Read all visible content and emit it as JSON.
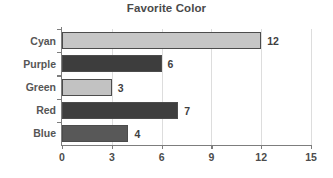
{
  "chart_data": {
    "type": "bar",
    "orientation": "horizontal",
    "title": "Favorite Color",
    "xlabel": "",
    "ylabel": "",
    "categories": [
      "Cyan",
      "Purple",
      "Green",
      "Red",
      "Blue"
    ],
    "values": [
      12,
      6,
      3,
      7,
      4
    ],
    "value_labels": [
      "12",
      "6",
      "3",
      "7",
      "4"
    ],
    "bar_colors": [
      "#c6c6c6",
      "#3d3d3d",
      "#c2c2c2",
      "#3e3e3e",
      "#585858"
    ],
    "bar_border_color": "#4c4c4c",
    "xlim": [
      0,
      15
    ],
    "xticks": [
      0,
      3,
      6,
      9,
      12,
      15
    ],
    "xtick_labels": [
      "0",
      "3",
      "6",
      "9",
      "12",
      "15"
    ],
    "grid": true,
    "grid_axis": "x",
    "grid_color": "#dddddd",
    "legend": false,
    "axis_color": "#7d7d7d",
    "title_color": "#4a4a4a",
    "background_color": "#ffffff"
  }
}
